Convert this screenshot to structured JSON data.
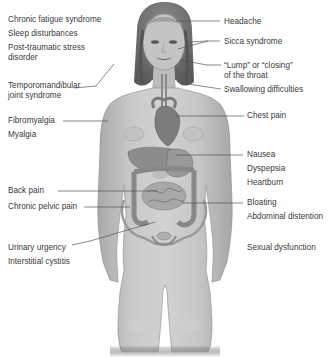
{
  "diagram": {
    "colors": {
      "text": "#3a3a3a",
      "leader_line": "#555555",
      "skin": "#bdbdbd",
      "organs": "#8a8a8a",
      "background": "#ffffff"
    },
    "left_labels": [
      {
        "id": "chronic-fatigue",
        "text": "Chronic fatigue syndrome"
      },
      {
        "id": "sleep",
        "text": "Sleep disturbances"
      },
      {
        "id": "ptsd-1",
        "text": "Post-traumatic stress"
      },
      {
        "id": "ptsd-2",
        "text": "disorder"
      },
      {
        "id": "tmj-1",
        "text": "Temporomandibular"
      },
      {
        "id": "tmj-2",
        "text": "joint syndrome"
      },
      {
        "id": "fibromyalgia",
        "text": "Fibromyalgia"
      },
      {
        "id": "myalgia",
        "text": "Myalgia"
      },
      {
        "id": "back-pain",
        "text": "Back pain"
      },
      {
        "id": "pelvic-pain",
        "text": "Chronic pelvic pain"
      },
      {
        "id": "urinary",
        "text": "Urinary urgency"
      },
      {
        "id": "cystitis",
        "text": "Interstitial cystitis"
      }
    ],
    "right_labels": [
      {
        "id": "headache",
        "text": "Headache"
      },
      {
        "id": "sicca",
        "text": "Sicca syndrome"
      },
      {
        "id": "lump-1",
        "text": "“Lump” or “closing”"
      },
      {
        "id": "lump-2",
        "text": "of the throat"
      },
      {
        "id": "swallowing",
        "text": "Swallowing difficulties"
      },
      {
        "id": "chest-pain",
        "text": "Chest pain"
      },
      {
        "id": "nausea",
        "text": "Nausea"
      },
      {
        "id": "dyspepsia",
        "text": "Dyspepsia"
      },
      {
        "id": "heartburn",
        "text": "Heartburn"
      },
      {
        "id": "bloating",
        "text": "Bloating"
      },
      {
        "id": "abdominal",
        "text": "Abdominal distention"
      },
      {
        "id": "sexual",
        "text": "Sexual dysfunction"
      }
    ]
  }
}
